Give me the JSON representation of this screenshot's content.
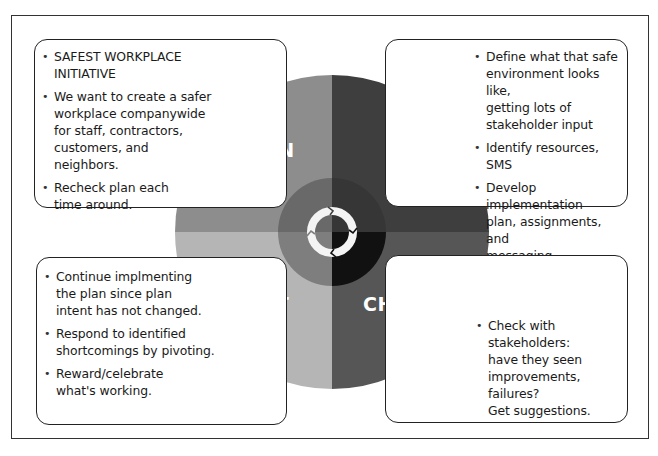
{
  "diagram": {
    "type": "PDCA cycle",
    "quadrants": [
      {
        "key": "plan",
        "label": "PLAN",
        "color": "#8d8d8d",
        "inner_color": "#696969"
      },
      {
        "key": "do",
        "label": "DO",
        "color": "#3e3e3e",
        "inner_color": "#363636"
      },
      {
        "key": "act",
        "label": "ACT",
        "color": "#b5b5b5",
        "inner_color": "#7e7e7e"
      },
      {
        "key": "check",
        "label": "CHECK",
        "color": "#565656",
        "inner_color": "#111111"
      }
    ],
    "center_icon": "cycle-arrows-icon"
  },
  "boxes": {
    "plan": {
      "items": [
        "SAFEST WORKPLACE\nINITIATIVE",
        "We want to create a safer\nworkplace companywide\nfor staff, contractors,\ncustomers, and\nneighbors.",
        "Recheck plan each\ntime around."
      ]
    },
    "do": {
      "items": [
        "Define what that safe\nenvironment looks like,\ngetting lots of\nstakeholder input",
        "Identify resources, SMS",
        "Develop implementation\nplan, assignments, and\nmessaging"
      ]
    },
    "act": {
      "items": [
        "Continue implmenting\n the plan since plan\nintent has not changed.",
        "Respond to identified\nshortcomings by pivoting.",
        "Reward/celebrate\nwhat's working."
      ]
    },
    "check": {
      "items": [
        "Check with\nstakeholders:\nhave they seen\nimprovements, failures?\nGet suggestions."
      ]
    }
  }
}
